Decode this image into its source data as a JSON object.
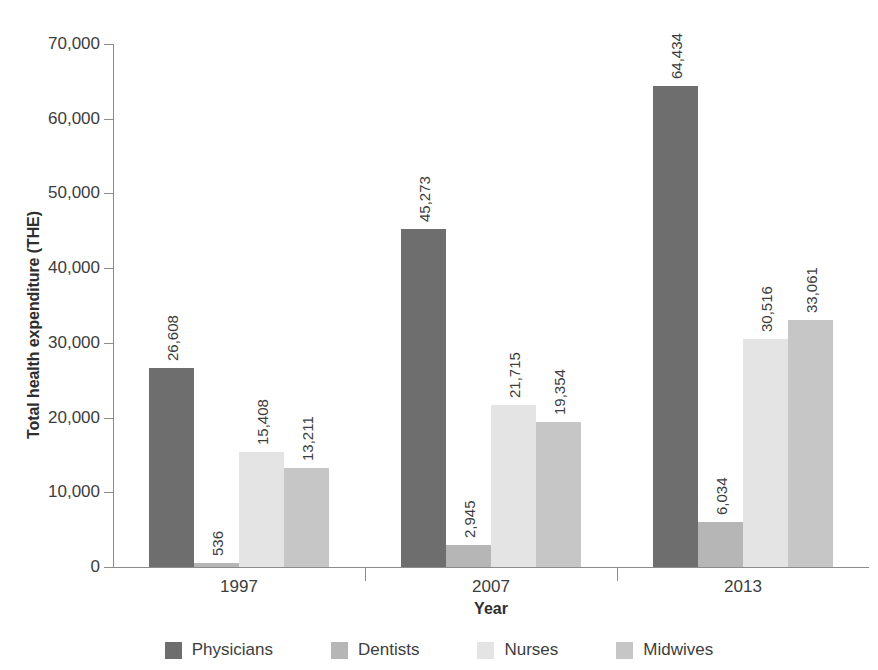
{
  "chart_data": {
    "type": "bar",
    "title": "",
    "xlabel": "Year",
    "ylabel": "Total health expenditure (THE)",
    "categories": [
      "1997",
      "2007",
      "2013"
    ],
    "series": [
      {
        "name": "Physicians",
        "color": "#6e6e6e",
        "values": [
          26608,
          45273,
          64434
        ],
        "labels": [
          "26,608",
          "45,273",
          "64,434"
        ]
      },
      {
        "name": "Dentists",
        "color": "#b6b6b6",
        "values": [
          536,
          2945,
          6034
        ],
        "labels": [
          "536",
          "2,945",
          "6,034"
        ]
      },
      {
        "name": "Nurses",
        "color": "#e4e4e4",
        "values": [
          15408,
          21715,
          30516
        ],
        "labels": [
          "15,408",
          "21,715",
          "30,516"
        ]
      },
      {
        "name": "Midwives",
        "color": "#c6c6c6",
        "values": [
          13211,
          19354,
          33061
        ],
        "labels": [
          "13,211",
          "19,354",
          "33,061"
        ]
      }
    ],
    "ylim": [
      0,
      70000
    ],
    "yticks": [
      0,
      10000,
      20000,
      30000,
      40000,
      50000,
      60000,
      70000
    ],
    "ytick_labels": [
      "0",
      "10,000",
      "20,000",
      "30,000",
      "40,000",
      "50,000",
      "60,000",
      "70,000"
    ],
    "grid": false,
    "legend_position": "bottom",
    "data_labels_rotated": true
  },
  "axes": {
    "y_title": "Total health expenditure (THE)",
    "x_title": "Year"
  },
  "legend": {
    "items": [
      {
        "label": "Physicians",
        "color": "#6e6e6e"
      },
      {
        "label": "Dentists",
        "color": "#b6b6b6"
      },
      {
        "label": "Nurses",
        "color": "#e4e4e4"
      },
      {
        "label": "Midwives",
        "color": "#c6c6c6"
      }
    ]
  }
}
